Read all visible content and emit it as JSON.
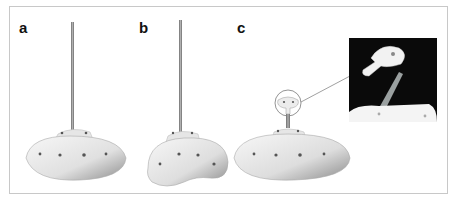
{
  "figure": {
    "panels": [
      {
        "label": "a",
        "description": "oval base plate with vertical rod"
      },
      {
        "label": "b",
        "description": "kidney-shaped base plate with vertical rod"
      },
      {
        "label": "c",
        "description": "oval base plate with short post and circled connector head"
      }
    ],
    "inset": {
      "description": "magnified connector head on dark background"
    },
    "colors": {
      "frame_border": "#c8c8c8",
      "plate_light": "#f4f4f4",
      "plate_dark": "#9a9a9a",
      "rod": "#8c8c8c",
      "inset_bg": "#0a0a0a",
      "label": "#111111"
    }
  }
}
